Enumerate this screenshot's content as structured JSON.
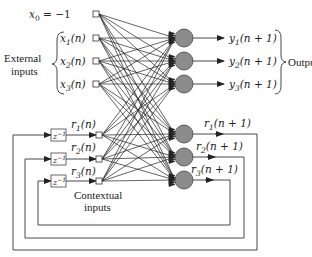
{
  "diagram": {
    "colors": {
      "line": "#222222",
      "neuron_fill": "#8c8c8c",
      "neuron_stroke": "#444444",
      "background": "#ffffff"
    },
    "bias_input": {
      "label": "x",
      "subscript": "0",
      "suffix": " = −1"
    },
    "external_inputs": [
      {
        "label": "x",
        "subscript": "1",
        "suffix": "(n)"
      },
      {
        "label": "x",
        "subscript": "2",
        "suffix": "(n)"
      },
      {
        "label": "x",
        "subscript": "3",
        "suffix": "(n)"
      }
    ],
    "external_group_label": [
      "External",
      "inputs"
    ],
    "context_inputs": [
      {
        "label": "r",
        "subscript": "1",
        "suffix": "(n)"
      },
      {
        "label": "r",
        "subscript": "2",
        "suffix": "(n)"
      },
      {
        "label": "r",
        "subscript": "3",
        "suffix": "(n)"
      }
    ],
    "context_group_label": [
      "Contextual",
      "inputs"
    ],
    "delay_block": {
      "base": "z",
      "superscript": "−1"
    },
    "outputs": [
      {
        "label": "y",
        "subscript": "1",
        "suffix": "(n + 1)"
      },
      {
        "label": "y",
        "subscript": "2",
        "suffix": "(n + 1)"
      },
      {
        "label": "y",
        "subscript": "3",
        "suffix": "(n + 1)"
      }
    ],
    "outputs_group_label": "Outputs",
    "recurrent_outputs": [
      {
        "label": "r",
        "subscript": "1",
        "suffix": "(n + 1)"
      },
      {
        "label": "r",
        "subscript": "2",
        "suffix": "(n + 1)"
      },
      {
        "label": "r",
        "subscript": "3",
        "suffix": "(n + 1)"
      }
    ],
    "icons": {
      "input_node": "small-square",
      "neuron": "gray-circle",
      "delay": "z-inverse-box"
    }
  }
}
